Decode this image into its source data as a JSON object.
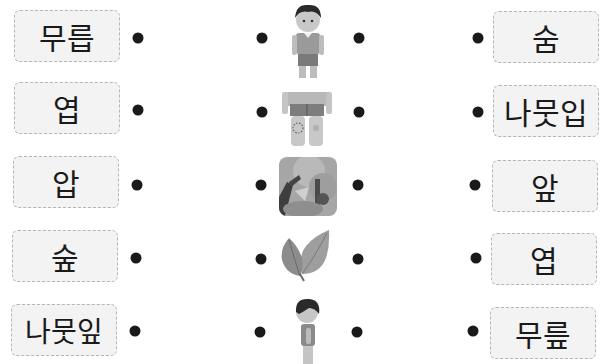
{
  "left_words": [
    "무릅",
    "엽",
    "압",
    "숲",
    "나뭇잎"
  ],
  "right_words": [
    "숨",
    "나뭇입",
    "앞",
    "엽",
    "무릎"
  ],
  "pictures": [
    {
      "name": "boy-front-icon",
      "desc": "boy standing front view"
    },
    {
      "name": "knee-icon",
      "desc": "legs with scraped knee"
    },
    {
      "name": "forest-icon",
      "desc": "forest scene"
    },
    {
      "name": "leaf-icon",
      "desc": "two leaves"
    },
    {
      "name": "boy-side-icon",
      "desc": "boy standing side view"
    }
  ],
  "colors": {
    "dot": "#1a1a1a",
    "box_bg": "#f3f3f3",
    "box_border": "#b5b5b5"
  }
}
